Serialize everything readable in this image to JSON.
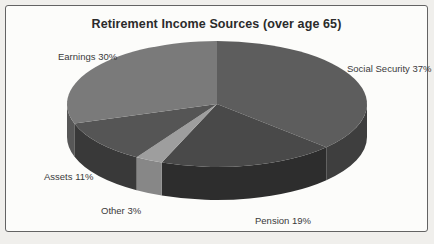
{
  "page": {
    "background_color": "#f0efec",
    "frame_border_color": "#636363",
    "frame_fill_color": "#fcfcfa"
  },
  "chart_data": {
    "type": "pie",
    "title": "Retirement Income Sources (over age 65)",
    "effect": "3d",
    "start_angle_deg": 0,
    "direction": "clockwise",
    "legend_position": "none",
    "labels_position": "outside",
    "categories": [
      "Social Security",
      "Pension",
      "Other",
      "Assets",
      "Earnings"
    ],
    "values": [
      37,
      19,
      3,
      11,
      30
    ],
    "series": [
      {
        "name": "Social Security",
        "value": 37,
        "label": "Social Security 37%",
        "color_top": "#5d5d5d",
        "color_side": "#3e3e3e"
      },
      {
        "name": "Pension",
        "value": 19,
        "label": "Pension 19%",
        "color_top": "#494949",
        "color_side": "#2d2d2d"
      },
      {
        "name": "Other",
        "value": 3,
        "label": "Other 3%",
        "color_top": "#9e9e9e",
        "color_side": "#878787"
      },
      {
        "name": "Assets",
        "value": 11,
        "label": "Assets 11%",
        "color_top": "#555555",
        "color_side": "#393939"
      },
      {
        "name": "Earnings",
        "value": 30,
        "label": "Earnings 30%",
        "color_top": "#7a7a7a",
        "color_side": "#575757"
      }
    ]
  }
}
